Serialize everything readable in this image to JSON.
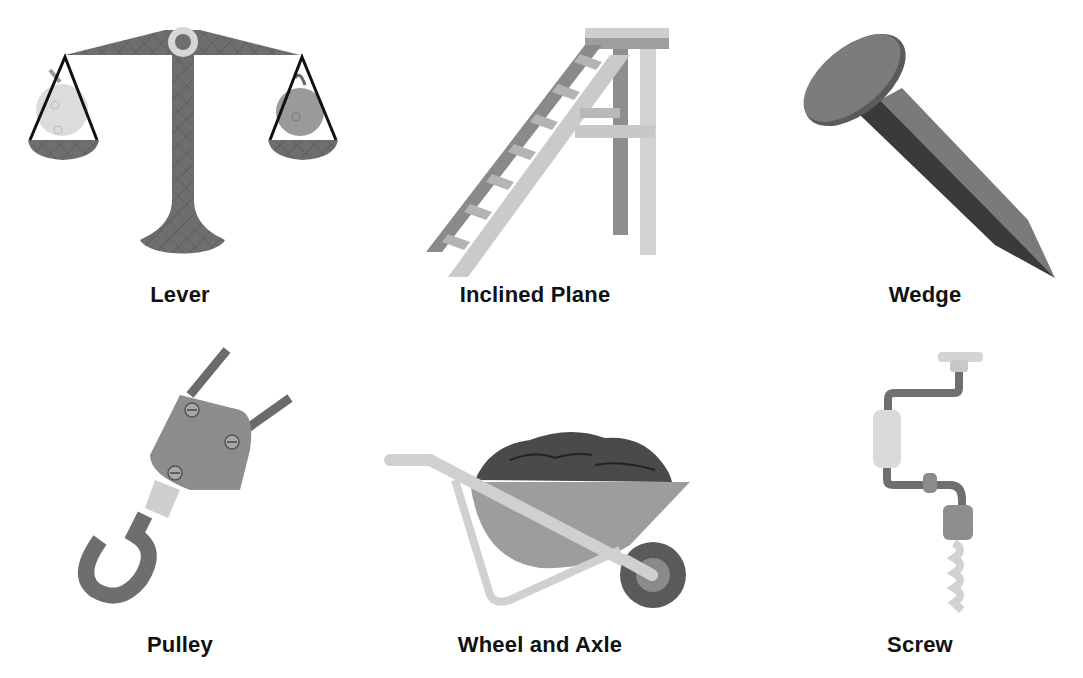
{
  "machines": [
    {
      "name": "Lever",
      "icon": "balance-scale-icon"
    },
    {
      "name": "Inclined Plane",
      "icon": "ladder-icon"
    },
    {
      "name": "Wedge",
      "icon": "nail-icon"
    },
    {
      "name": "Pulley",
      "icon": "pulley-hook-icon"
    },
    {
      "name": "Wheel and Axle",
      "icon": "wheelbarrow-icon"
    },
    {
      "name": "Screw",
      "icon": "hand-drill-icon"
    }
  ],
  "colors": {
    "background": "#ffffff",
    "dark_gray": "#6b6b6b",
    "mid_gray": "#9a9a9a",
    "light_gray": "#cfcfcf",
    "label_text": "#111111"
  }
}
